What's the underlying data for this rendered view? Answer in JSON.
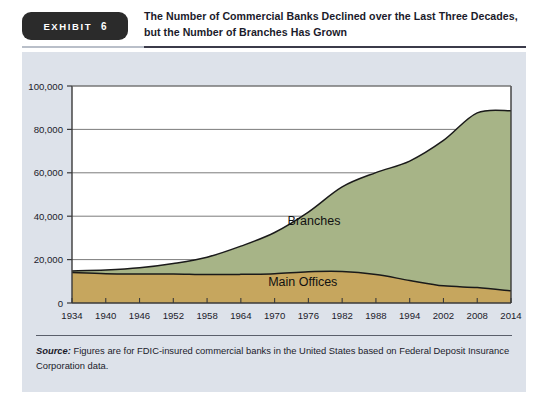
{
  "exhibit": {
    "badge_word": "EXHIBIT",
    "badge_number": "6",
    "title": "The Number of Commercial Banks Declined over the Last Three Decades, but the Number of Branches Has Grown",
    "source_label": "Source:",
    "source_text": " Figures are for FDIC-insured commercial banks in the United States based on Federal Deposit Insurance Corporation data."
  },
  "colors": {
    "branches_fill": "#a7b487",
    "main_offices_fill": "#c6a65e",
    "series_outline": "#1a1a1a",
    "gridline": "#6d6d6d",
    "axis": "#3a3a3a",
    "plot_background": "#ffffff",
    "panel_background": "#dde2ea",
    "badge_background": "#2b2b2b",
    "text": "#1b1b2b"
  },
  "chart_data": {
    "type": "area",
    "stacked": true,
    "title": "The Number of Commercial Banks Declined over the Last Three Decades, but the Number of Branches Has Grown",
    "xlabel": "",
    "ylabel": "",
    "xlim": [
      1934,
      2014
    ],
    "ylim": [
      0,
      100000
    ],
    "grid": true,
    "legend_position": "inline-labels",
    "x_tick_labels": [
      "1934",
      "1940",
      "1946",
      "1952",
      "1958",
      "1964",
      "1970",
      "1976",
      "1982",
      "1988",
      "1994",
      "2002",
      "2008",
      "2014"
    ],
    "x_tick_values": [
      1934,
      1940,
      1946,
      1952,
      1958,
      1964,
      1970,
      1976,
      1982,
      1988,
      1994,
      2002,
      2008,
      2014
    ],
    "y_tick_labels": [
      "0",
      "20,000",
      "40,000",
      "60,000",
      "80,000",
      "100,000"
    ],
    "y_tick_values": [
      0,
      20000,
      40000,
      60000,
      80000,
      100000
    ],
    "x": [
      1934,
      1940,
      1946,
      1952,
      1958,
      1964,
      1970,
      1976,
      1982,
      1988,
      1994,
      2002,
      2008,
      2014
    ],
    "series": [
      {
        "name": "Main Offices",
        "label": "Main Offices",
        "fill": "#c6a65e",
        "values": [
          14000,
          13500,
          13400,
          13400,
          13100,
          13200,
          13500,
          14400,
          14500,
          13100,
          10400,
          7900,
          7100,
          5600
        ]
      },
      {
        "name": "Branches",
        "label": "Branches",
        "fill": "#a7b487",
        "values": [
          800,
          1700,
          2800,
          4800,
          8000,
          13000,
          19000,
          27500,
          39000,
          47000,
          55000,
          67000,
          80500,
          83000
        ]
      }
    ],
    "totals": [
      14800,
      15200,
      16200,
      18200,
      21100,
      26200,
      32500,
      41900,
      53500,
      60100,
      65400,
      74900,
      87600,
      88600
    ],
    "annotations": [
      {
        "text": "Branches",
        "x": 1977,
        "y": 36000
      },
      {
        "text": "Main Offices",
        "x": 1975,
        "y": 8000
      }
    ]
  }
}
